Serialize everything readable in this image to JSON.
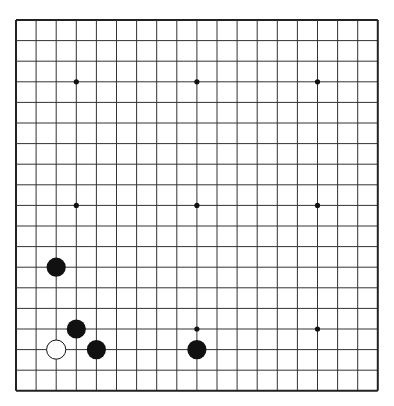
{
  "board": {
    "size": 19,
    "origin": [
      16,
      20
    ],
    "spacing": [
      20.1,
      20.6
    ],
    "background": "#ffffff",
    "line_color": "#333333",
    "border_color": "#222222",
    "star_points": [
      [
        3,
        3
      ],
      [
        9,
        3
      ],
      [
        15,
        3
      ],
      [
        3,
        9
      ],
      [
        9,
        9
      ],
      [
        15,
        9
      ],
      [
        3,
        15
      ],
      [
        9,
        15
      ],
      [
        15,
        15
      ]
    ],
    "stones": [
      {
        "color": "black",
        "col": 2,
        "row": 12
      },
      {
        "color": "black",
        "col": 3,
        "row": 15
      },
      {
        "color": "white",
        "col": 2,
        "row": 16
      },
      {
        "color": "black",
        "col": 4,
        "row": 16
      },
      {
        "color": "black",
        "col": 9,
        "row": 16
      }
    ],
    "stone_colors": {
      "black": "#111111",
      "white": "#ffffff",
      "white_outline": "#111111"
    }
  }
}
